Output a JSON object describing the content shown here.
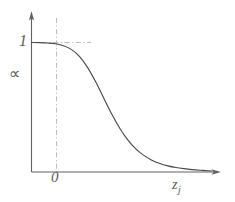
{
  "figure": {
    "background_color": "#ffffff",
    "line_color": "#4a4a4a",
    "axis_color": "#5a5a5a",
    "guide_color": "#b0b0b0"
  },
  "labels": {
    "y_tick_one": "1",
    "x_tick_zero": "0",
    "y_axis_symbol": "∝",
    "x_axis_symbol": "z",
    "x_axis_subscript": "j"
  },
  "chart_data": {
    "type": "line",
    "title": "",
    "xlabel": "z_j",
    "ylabel": "∝",
    "xlim": [
      -1.6,
      7.4
    ],
    "ylim": [
      0,
      1.12
    ],
    "grid": false,
    "legend": null,
    "axis_arrows": {
      "x": true,
      "y": true
    },
    "xticks": [
      0
    ],
    "xticklabels": [
      "0"
    ],
    "yticks": [
      1
    ],
    "yticklabels": [
      "1"
    ],
    "annotations": [
      {
        "kind": "guide-line",
        "orientation": "vertical",
        "x": 0,
        "style": "dash-dot",
        "color": "#b0b0b0",
        "from_y": 0,
        "to_y": 1.12
      },
      {
        "kind": "guide-line",
        "orientation": "horizontal",
        "y": 1,
        "style": "dash-dot",
        "color": "#b0b0b0",
        "from_x": -1.6,
        "to_x": 1.3
      }
    ],
    "series": [
      {
        "name": "sigmoid-decay",
        "description": "logistic decay curve approaching 1 at left and 0 at right",
        "color": "#4a4a4a",
        "x": [
          -1.6,
          -1.2,
          -0.8,
          -0.4,
          0.0,
          0.4,
          0.8,
          1.2,
          1.6,
          2.0,
          2.4,
          2.8,
          3.2,
          3.6,
          4.0,
          4.4,
          4.8,
          5.2,
          5.6,
          6.0,
          6.4,
          6.8,
          7.2,
          7.4
        ],
        "y": [
          1.0,
          0.999,
          0.996,
          0.99,
          0.975,
          0.945,
          0.89,
          0.805,
          0.695,
          0.57,
          0.445,
          0.335,
          0.245,
          0.175,
          0.125,
          0.088,
          0.062,
          0.044,
          0.031,
          0.022,
          0.015,
          0.01,
          0.006,
          0.004
        ]
      }
    ]
  }
}
